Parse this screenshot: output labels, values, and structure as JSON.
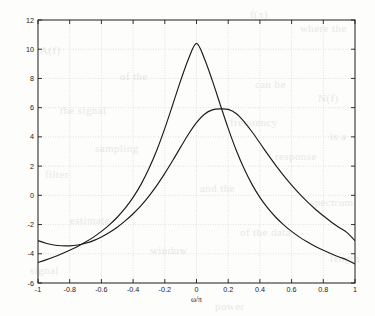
{
  "figure": {
    "background_color": "#fdfdfc",
    "axis_color": "#1c1c1c",
    "grid_color": "#b9b9b9",
    "curve_color": "#1b1b1b"
  },
  "bleed_text": [
    {
      "text": "f(x)",
      "x": 250,
      "y": 8
    },
    {
      "text": "where the",
      "x": 300,
      "y": 22
    },
    {
      "text": "A(f)",
      "x": 40,
      "y": 44
    },
    {
      "text": "of the",
      "x": 120,
      "y": 70
    },
    {
      "text": "can be",
      "x": 255,
      "y": 78
    },
    {
      "text": "N(f)",
      "x": 318,
      "y": 92
    },
    {
      "text": "the signal",
      "x": 60,
      "y": 104
    },
    {
      "text": "frequency",
      "x": 230,
      "y": 116
    },
    {
      "text": "is a",
      "x": 330,
      "y": 130
    },
    {
      "text": "sampling",
      "x": 95,
      "y": 142
    },
    {
      "text": "response",
      "x": 275,
      "y": 150
    },
    {
      "text": "filter",
      "x": 45,
      "y": 168
    },
    {
      "text": "and the",
      "x": 200,
      "y": 182
    },
    {
      "text": "spectrum",
      "x": 310,
      "y": 196
    },
    {
      "text": "estimate",
      "x": 70,
      "y": 214
    },
    {
      "text": "of the data",
      "x": 240,
      "y": 226
    },
    {
      "text": "window",
      "x": 150,
      "y": 244
    },
    {
      "text": "length",
      "x": 330,
      "y": 252
    },
    {
      "text": "signal",
      "x": 30,
      "y": 264
    },
    {
      "text": "power",
      "x": 215,
      "y": 300
    }
  ],
  "chart_data": {
    "type": "line",
    "title": "",
    "xlabel": "ω/π",
    "ylabel": "",
    "xlim": [
      -1,
      1
    ],
    "ylim": [
      -6,
      12
    ],
    "grid": true,
    "legend": null,
    "xticks": [
      -1,
      -0.8,
      -0.6,
      -0.4,
      -0.2,
      0,
      0.2,
      0.4,
      0.6,
      0.8,
      1
    ],
    "xticklabels": [
      "-1",
      "-0.8",
      "-0.6",
      "-0.4",
      "-0.2",
      "0",
      "0.2",
      "0.4",
      "0.6",
      "0.8",
      "1"
    ],
    "yticks": [
      -6,
      -4,
      -2,
      0,
      2,
      4,
      6,
      8,
      10,
      12
    ],
    "yticklabels": [
      "-6",
      "-4",
      "-2",
      "0",
      "2",
      "4",
      "6",
      "8",
      "10",
      "12"
    ],
    "series": [
      {
        "name": "narrowband peak at 0",
        "peak_x": 0.0,
        "peak_y": 10.4,
        "x": [
          -1.0,
          -0.95,
          -0.9,
          -0.85,
          -0.8,
          -0.75,
          -0.7,
          -0.65,
          -0.6,
          -0.55,
          -0.5,
          -0.45,
          -0.4,
          -0.35,
          -0.3,
          -0.25,
          -0.2,
          -0.15,
          -0.1,
          -0.05,
          0.0,
          0.05,
          0.1,
          0.15,
          0.2,
          0.25,
          0.3,
          0.35,
          0.4,
          0.45,
          0.5,
          0.55,
          0.6,
          0.65,
          0.7,
          0.75,
          0.8,
          0.85,
          0.9,
          0.95,
          1.0
        ],
        "y": [
          -4.6,
          -4.42,
          -4.22,
          -4.0,
          -3.76,
          -3.5,
          -3.2,
          -2.86,
          -2.47,
          -2.02,
          -1.5,
          -0.88,
          -0.14,
          0.75,
          1.83,
          3.1,
          4.58,
          6.2,
          7.85,
          9.35,
          10.4,
          9.35,
          7.85,
          6.2,
          4.58,
          3.1,
          1.83,
          0.75,
          -0.14,
          -0.88,
          -1.5,
          -2.02,
          -2.47,
          -2.86,
          -3.2,
          -3.5,
          -3.76,
          -4.0,
          -4.22,
          -4.42,
          -4.7
        ]
      },
      {
        "name": "broadband peak at 0.2",
        "peak_x": 0.2,
        "peak_y": 5.9,
        "x": [
          -1.0,
          -0.95,
          -0.9,
          -0.85,
          -0.8,
          -0.75,
          -0.7,
          -0.65,
          -0.6,
          -0.55,
          -0.5,
          -0.45,
          -0.4,
          -0.35,
          -0.3,
          -0.25,
          -0.2,
          -0.15,
          -0.1,
          -0.05,
          0.0,
          0.05,
          0.1,
          0.15,
          0.2,
          0.25,
          0.3,
          0.35,
          0.4,
          0.45,
          0.5,
          0.55,
          0.6,
          0.65,
          0.7,
          0.75,
          0.8,
          0.85,
          0.9,
          0.95,
          1.0
        ],
        "y": [
          -3.1,
          -3.28,
          -3.4,
          -3.45,
          -3.46,
          -3.4,
          -3.28,
          -3.1,
          -2.85,
          -2.54,
          -2.18,
          -1.75,
          -1.26,
          -0.7,
          -0.05,
          0.68,
          1.5,
          2.38,
          3.3,
          4.2,
          4.98,
          5.55,
          5.85,
          5.92,
          5.88,
          5.6,
          5.05,
          4.35,
          3.58,
          2.8,
          2.05,
          1.35,
          0.7,
          0.1,
          -0.45,
          -0.95,
          -1.4,
          -1.82,
          -2.2,
          -2.55,
          -3.1
        ]
      }
    ]
  }
}
